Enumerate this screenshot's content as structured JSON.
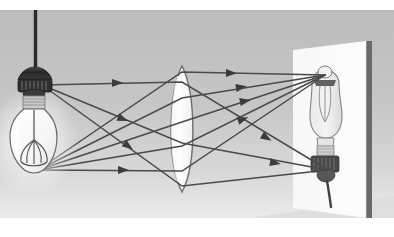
{
  "figure": {
    "type": "optics-ray-diagram",
    "canvas": {
      "width": 394,
      "height": 237
    },
    "scene_rect": {
      "x": 0,
      "y": 10,
      "width": 394,
      "height": 208
    },
    "background": {
      "top_band_color": "#ffffff",
      "bottom_band_color": "#ffffff",
      "wall_gradient_top": "#bfbfbf",
      "wall_gradient_mid": "#c6c6c6",
      "wall_gradient_bottom": "#e8e8e8",
      "floor_shadow_color": "#d6d6d6"
    }
  },
  "colors": {
    "ray": "#4a4a4a",
    "ray_arrow": "#3c3c3c",
    "lens_fill": "#fdfdfd",
    "lens_stroke": "#6e6e6e",
    "screen_fill": "#fbfbfb",
    "screen_edge": "#6a6a6a",
    "cord": "#2b2b2b",
    "socket_dark": "#2e2e2e",
    "socket_mid": "#555555",
    "socket_light": "#9a9a9a",
    "bulb_glass": "#fcfcfc",
    "bulb_outline": "#6b6b6b",
    "filament": "#4d4d4d",
    "glow": "#ffffff",
    "image_bulb_glass": "#efefef",
    "image_bulb_outline": "#777777"
  },
  "objects": {
    "cord": {
      "name": "hanging-cord",
      "x": 35.5,
      "y_top": 10,
      "y_bottom": 66,
      "width": 3.2
    },
    "object_bulb": {
      "name": "object-light-bulb",
      "label": "light bulb (object)",
      "socket_center": {
        "x": 35,
        "y": 76
      },
      "bulb_center": {
        "x": 33,
        "y": 132
      },
      "bulb_radius_x": 23,
      "bulb_radius_y": 30,
      "tip_point": {
        "x": 39,
        "y": 70
      },
      "base_point": {
        "x": 31,
        "y": 163
      }
    },
    "lens": {
      "name": "converging-lens",
      "label": "biconvex converging lens",
      "center_x": 182,
      "center_y": 119,
      "half_height": 63,
      "half_width": 15,
      "top_vertex": {
        "x": 182,
        "y": 56
      },
      "bottom_vertex": {
        "x": 182,
        "y": 182
      }
    },
    "screen": {
      "name": "projection-screen",
      "label": "screen",
      "quad": [
        [
          293,
          40
        ],
        [
          366,
          31
        ],
        [
          366,
          208
        ],
        [
          293,
          198
        ]
      ],
      "edge_bar": {
        "x": 368,
        "y_top": 31,
        "y_bottom": 209,
        "width": 5
      }
    },
    "image_bulb": {
      "name": "projected-inverted-image",
      "label": "real inverted image on screen",
      "tip_point": {
        "x": 325,
        "y": 66
      },
      "base_point": {
        "x": 331,
        "y": 161
      },
      "bulb_center": {
        "x": 325,
        "y": 93
      },
      "bulb_radius_x": 17,
      "bulb_radius_y": 28
    }
  },
  "ray_diagram": {
    "source_points": [
      {
        "name": "tip-source",
        "x": 42,
        "y": 75,
        "converges_to": {
          "x": 328,
          "y": 160
        }
      },
      {
        "name": "base-source",
        "x": 38,
        "y": 160,
        "converges_to": {
          "x": 325,
          "y": 65
        }
      }
    ],
    "rays": [
      {
        "id": "r1",
        "from": "tip-source",
        "kind": "parallel-then-refracted",
        "p0": [
          42,
          75
        ],
        "p1": [
          182,
          72
        ],
        "p2": [
          328,
          160
        ],
        "arrows": [
          {
            "x": 112,
            "y": 73,
            "angle": -1
          },
          {
            "x": 262,
            "y": 125,
            "angle": 31
          }
        ]
      },
      {
        "id": "r2",
        "from": "tip-source",
        "kind": "oblique-refracted",
        "p0": [
          42,
          75
        ],
        "p1": [
          182,
          133
        ],
        "p2": [
          328,
          160
        ],
        "arrows": [
          {
            "x": 118,
            "y": 107,
            "angle": 22
          },
          {
            "x": 270,
            "y": 152,
            "angle": 10
          }
        ]
      },
      {
        "id": "r3",
        "from": "tip-source",
        "kind": "oblique-refracted",
        "p0": [
          42,
          75
        ],
        "p1": [
          182,
          176
        ],
        "p2": [
          328,
          160
        ],
        "arrows": [
          {
            "x": 124,
            "y": 133,
            "angle": 36
          }
        ]
      },
      {
        "id": "r4",
        "from": "base-source",
        "kind": "oblique-refracted",
        "p0": [
          38,
          160
        ],
        "p1": [
          182,
          62
        ],
        "p2": [
          325,
          65
        ],
        "arrows": [
          {
            "x": 226,
            "y": 63,
            "angle": 1
          }
        ]
      },
      {
        "id": "r5",
        "from": "base-source",
        "kind": "oblique-refracted",
        "p0": [
          38,
          160
        ],
        "p1": [
          182,
          88
        ],
        "p2": [
          325,
          65
        ],
        "arrows": [
          {
            "x": 236,
            "y": 78,
            "angle": -9
          }
        ]
      },
      {
        "id": "r6",
        "from": "base-source",
        "kind": "oblique-refracted",
        "p0": [
          38,
          160
        ],
        "p1": [
          182,
          112
        ],
        "p2": [
          325,
          65
        ],
        "arrows": [
          {
            "x": 240,
            "y": 92,
            "angle": -11
          }
        ]
      },
      {
        "id": "r7",
        "from": "base-source",
        "kind": "oblique-refracted",
        "p0": [
          38,
          160
        ],
        "p1": [
          182,
          136
        ],
        "p2": [
          325,
          65
        ],
        "arrows": [
          {
            "x": 238,
            "y": 111,
            "angle": -20
          }
        ]
      },
      {
        "id": "r8",
        "from": "base-source",
        "kind": "parallel-then-refracted",
        "p0": [
          38,
          160
        ],
        "p1": [
          182,
          161
        ],
        "p2": [
          325,
          65
        ],
        "arrows": [
          {
            "x": 118,
            "y": 160,
            "angle": 0
          }
        ]
      }
    ],
    "notes": {
      "principal_axis_hint": "rays from bulb tip converge below; rays from base converge above, forming an inverted real image"
    }
  }
}
